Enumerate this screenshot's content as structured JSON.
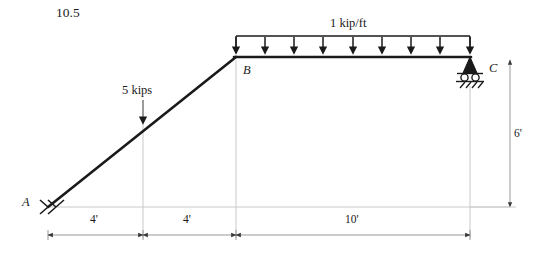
{
  "figure": {
    "problem_number": "10.5",
    "type": "structural-frame-free-body-diagram",
    "nodes": [
      {
        "id": "A",
        "label": "A",
        "support": "pin",
        "x_ft": 0,
        "y_ft": 0
      },
      {
        "id": "B",
        "label": "B",
        "support": "none",
        "x_ft": 8,
        "y_ft": 6
      },
      {
        "id": "C",
        "label": "C",
        "support": "roller",
        "x_ft": 18,
        "y_ft": 6
      }
    ],
    "members": [
      {
        "from": "A",
        "to": "B",
        "orientation": "inclined"
      },
      {
        "from": "B",
        "to": "C",
        "orientation": "horizontal"
      }
    ],
    "loads": [
      {
        "id": "point-load-1",
        "kind": "point",
        "label": "5 kips",
        "magnitude": 5,
        "unit": "kips",
        "direction": "down",
        "applied_to_member": "A-B",
        "station_ft": 4
      },
      {
        "id": "distributed-load-1",
        "kind": "uniform-distributed",
        "label": "1 kip/ft",
        "magnitude": 1,
        "unit": "kip/ft",
        "direction": "down",
        "applied_to_member": "B-C",
        "span_ft": 10,
        "arrow_count": 9
      }
    ],
    "dimensions": [
      {
        "id": "dim-ab1",
        "label": "4'",
        "value": 4,
        "unit": "ft",
        "orientation": "horizontal"
      },
      {
        "id": "dim-ab2",
        "label": "4'",
        "value": 4,
        "unit": "ft",
        "orientation": "horizontal"
      },
      {
        "id": "dim-bc",
        "label": "10'",
        "value": 10,
        "unit": "ft",
        "orientation": "horizontal"
      },
      {
        "id": "dim-height",
        "label": "6'",
        "value": 6,
        "unit": "ft",
        "orientation": "vertical"
      }
    ],
    "colors": {
      "member": "#1a1a1a",
      "load": "#1a1a1a",
      "construction_line": "#c8c8c8",
      "dimension_line": "#8c8c8c",
      "background": "#ffffff"
    }
  }
}
